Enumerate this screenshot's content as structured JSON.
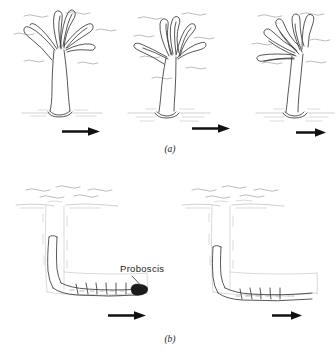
{
  "figure": {
    "background_color": "#ffffff",
    "ink_color": "#3a3a3a",
    "accent_color": "#111111"
  },
  "panels": [
    {
      "id": "a",
      "caption": "(a)",
      "caption_x": 170,
      "caption_y": 150,
      "subject": "tentacled-suspension-feeder",
      "frames": [
        {
          "index": 0,
          "label": "frame-a-1",
          "current_strength": "weak",
          "tentacle_state": "spread-upright",
          "arrow": {
            "x1": 62,
            "y1": 131,
            "x2": 100,
            "y2": 131,
            "length": 38
          }
        },
        {
          "index": 1,
          "label": "frame-a-2",
          "current_strength": "moderate",
          "tentacle_state": "swept-partially",
          "arrow": {
            "x1": 192,
            "y1": 128,
            "x2": 230,
            "y2": 128,
            "length": 38
          }
        },
        {
          "index": 2,
          "label": "frame-a-3",
          "current_strength": "strong",
          "tentacle_state": "swept-downstream",
          "arrow": {
            "x1": 296,
            "y1": 132,
            "x2": 326,
            "y2": 132,
            "length": 30
          }
        }
      ]
    },
    {
      "id": "b",
      "caption": "(b)",
      "caption_x": 170,
      "caption_y": 340,
      "subject": "burrowing-larva-in-L-burrow",
      "annotation": {
        "label": "Proboscis",
        "text_x": 120,
        "text_y": 271,
        "leader_from_x": 132,
        "leader_from_y": 275,
        "leader_to_x": 147,
        "leader_to_y": 292
      },
      "frames": [
        {
          "index": 0,
          "label": "frame-b-1",
          "larva_position": "proboscis-extended-right",
          "arrow": {
            "x1": 108,
            "y1": 315,
            "x2": 146,
            "y2": 315,
            "length": 38
          }
        },
        {
          "index": 1,
          "label": "frame-b-2",
          "larva_position": "body-advanced-along-burrow",
          "arrow": {
            "x1": 272,
            "y1": 315,
            "x2": 302,
            "y2": 315,
            "length": 30
          }
        }
      ]
    }
  ],
  "labels": {
    "caption_a": "(a)",
    "caption_b": "(b)",
    "proboscis": "Proboscis"
  }
}
